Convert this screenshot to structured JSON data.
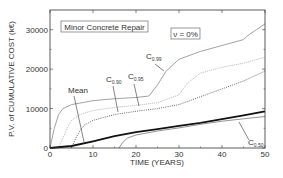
{
  "chart_data": {
    "type": "line",
    "title": "Minor Concrete Repair",
    "annotation_box": "ν = 0%",
    "xlabel": "TIME (YEARS)",
    "ylabel": "P.V. of CUMULATIVE COST (k€)",
    "xlim": [
      0,
      50
    ],
    "ylim": [
      0,
      35000
    ],
    "xticks": [
      0,
      10,
      20,
      30,
      40,
      50
    ],
    "yticks": [
      0,
      10000,
      20000,
      30000
    ],
    "grid": false,
    "legend": "none (inline labels with arrows)",
    "series": [
      {
        "name": "C0.99",
        "label_main": "C",
        "label_sub": "0.99",
        "style": "solid gray",
        "color": "#8a8a8a",
        "x": [
          0,
          1,
          2,
          3,
          5,
          10,
          15,
          20,
          23,
          25,
          27,
          30,
          35,
          40,
          45,
          46,
          48,
          50
        ],
        "y": [
          0,
          5000,
          8500,
          10000,
          11000,
          12000,
          12500,
          12800,
          13200,
          16000,
          19500,
          22500,
          24500,
          26000,
          27500,
          28500,
          30000,
          31500
        ]
      },
      {
        "name": "C0.95",
        "label_main": "C",
        "label_sub": "0.95",
        "style": "dotted light gray",
        "color": "#b8b8b8",
        "x": [
          2,
          3,
          4,
          5,
          7,
          10,
          15,
          20,
          25,
          30,
          32,
          35,
          40,
          45,
          50
        ],
        "y": [
          0,
          2500,
          5000,
          7000,
          8500,
          9500,
          10300,
          10800,
          11500,
          13500,
          16500,
          19000,
          20500,
          21500,
          23000
        ]
      },
      {
        "name": "C0.90",
        "label_main": "C",
        "label_sub": "0.90",
        "style": "dotted dark",
        "color": "#555555",
        "x": [
          5,
          6,
          7,
          8,
          10,
          15,
          20,
          25,
          30,
          35,
          40,
          45,
          50
        ],
        "y": [
          0,
          2500,
          4500,
          5800,
          7000,
          8500,
          9300,
          10000,
          11000,
          13000,
          15000,
          17000,
          19500
        ]
      },
      {
        "name": "Mean",
        "label_main": "Mean",
        "style": "thick solid black",
        "color": "#111111",
        "x": [
          0,
          5,
          10,
          15,
          20,
          25,
          30,
          35,
          40,
          45,
          50
        ],
        "y": [
          0,
          500,
          1700,
          3000,
          4000,
          4800,
          5600,
          6400,
          7300,
          8300,
          9300
        ]
      },
      {
        "name": "C0.50",
        "label_main": "C",
        "label_sub": "0.50",
        "style": "solid gray",
        "color": "#777777",
        "x": [
          16,
          17,
          18,
          20,
          25,
          30,
          35,
          40,
          45,
          50
        ],
        "y": [
          0,
          1500,
          2500,
          3300,
          4300,
          5100,
          6000,
          6800,
          7400,
          8000
        ]
      }
    ]
  }
}
